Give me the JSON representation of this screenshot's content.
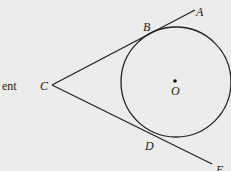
{
  "diagram": {
    "side_text": "ent",
    "labels": {
      "A": "A",
      "B": "B",
      "C": "C",
      "D": "D",
      "E": "E",
      "O": "O"
    },
    "colors": {
      "background": "#ececea",
      "stroke": "#222222"
    }
  }
}
